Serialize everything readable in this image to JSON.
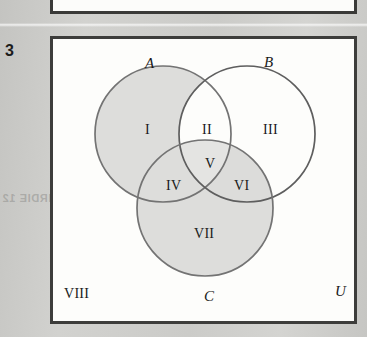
{
  "figure": {
    "number": "3",
    "universe_label": "U",
    "outside_region_label": "VIII"
  },
  "sets": [
    {
      "name": "A",
      "label": "A",
      "shaded": true,
      "cx": 160,
      "cy": 134,
      "r": 68
    },
    {
      "name": "B",
      "label": "B",
      "shaded": false,
      "cx": 244,
      "cy": 134,
      "r": 68
    },
    {
      "name": "C",
      "label": "C",
      "shaded": true,
      "cx": 202,
      "cy": 208,
      "r": 68
    }
  ],
  "regions": [
    {
      "id": "I",
      "label": "I",
      "description": "A only",
      "x": 142,
      "y": 123
    },
    {
      "id": "II",
      "label": "II",
      "description": "A and B only",
      "x": 199,
      "y": 123
    },
    {
      "id": "III",
      "label": "III",
      "description": "B only",
      "x": 260,
      "y": 123
    },
    {
      "id": "IV",
      "label": "IV",
      "description": "A and C only",
      "x": 163,
      "y": 179
    },
    {
      "id": "V",
      "label": "V",
      "description": "A and B and C",
      "x": 202,
      "y": 157
    },
    {
      "id": "VI",
      "label": "VI",
      "description": "B and C only",
      "x": 231,
      "y": 179
    },
    {
      "id": "VII",
      "label": "VII",
      "description": "C only",
      "x": 191,
      "y": 227
    },
    {
      "id": "VIII",
      "label": "VIII",
      "description": "outside A, B and C",
      "x": 61,
      "y": 287
    }
  ],
  "set_label_positions": {
    "A": {
      "x": 142,
      "y": 56
    },
    "B": {
      "x": 261,
      "y": 55
    },
    "C": {
      "x": 201,
      "y": 289
    },
    "U": {
      "x": 332,
      "y": 284
    }
  },
  "bleed_through_text": "ZOLS  N2792  S  VOE  8.X  SEE  ID  A  BIRDIE  12",
  "colors": {
    "page_background": "#cccbc8",
    "figure_background": "#fdfdfb",
    "figure_border": "#3d3d3b",
    "circle_stroke": "#6e6e6e",
    "shade_fill": "#dcdcda",
    "text": "#1a1a1a"
  }
}
